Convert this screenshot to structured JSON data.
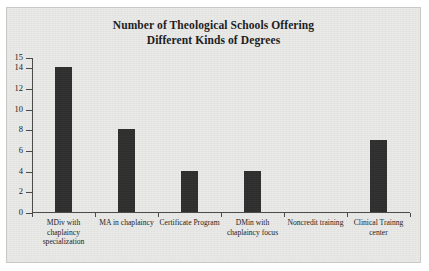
{
  "chart_data": {
    "type": "bar",
    "title": "Number of Theological Schools Offering Different Kinds of Degrees",
    "title_lines": [
      "Number of Theological Schools Offering",
      "Different Kinds of Degrees"
    ],
    "categories": [
      "MDiv with chaplaincy specialization",
      "MA in chaplaincy",
      "Certificate Program",
      "DMin with chaplaincy focus",
      "Noncredit training",
      "Clinical Trainng center"
    ],
    "category_lines": [
      [
        "MDiv with",
        "chaplaincy",
        "specialization"
      ],
      [
        "MA in chaplaincy"
      ],
      [
        "Certificate Program"
      ],
      [
        "DMin with",
        "chaplaincy focus"
      ],
      [
        "Noncredit training"
      ],
      [
        "Clinical Trainng",
        "center"
      ]
    ],
    "values": [
      14,
      8,
      4,
      4,
      0,
      7
    ],
    "xlabel": "",
    "ylabel": "",
    "ylim": [
      0,
      15
    ],
    "y_ticks": [
      0,
      2,
      4,
      6,
      8,
      10,
      12,
      14,
      15
    ],
    "y_tick_labels": [
      "0",
      "2",
      "4",
      "6",
      "8",
      "10",
      "12",
      "14",
      "15"
    ],
    "grid": false,
    "legend": false,
    "bar_color": "#2f2f2f",
    "plot_background": "#e9e9e7",
    "axis_color": "#4a4a4a",
    "text_color": "#1b1b1b"
  }
}
